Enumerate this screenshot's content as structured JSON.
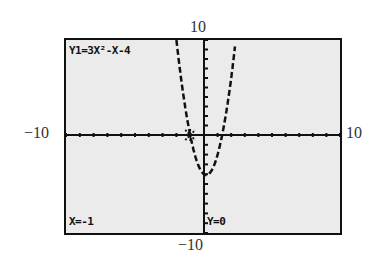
{
  "window": {
    "ymax_label": "10",
    "ymin_label": "−10",
    "xmin_label": "−10",
    "xmax_label": "10"
  },
  "screen": {
    "equation": "Y1=3X²-X-4",
    "trace_x": "X=-1",
    "trace_y": "Y=0",
    "background_color": "#ebebeb",
    "ink_color": "#111111"
  },
  "chart_data": {
    "type": "line",
    "title": "Y1=3X²-X-4",
    "function": "3x^2 - x - 4",
    "xlim": [
      -10,
      10
    ],
    "ylim": [
      -10,
      10
    ],
    "xscale": 1,
    "yscale": 1,
    "grid": false,
    "axes": true,
    "trace_point": {
      "x": -1,
      "y": 0
    },
    "x_intercepts": [
      -1,
      1.333
    ],
    "y_intercept": -4,
    "series": [
      {
        "name": "Y1",
        "style": "dashed",
        "x": [
          -1.8,
          -1.6,
          -1.4,
          -1.2,
          -1.0,
          -0.8,
          -0.6,
          -0.4,
          -0.2,
          0.0,
          0.2,
          0.4,
          0.6,
          0.8,
          1.0,
          1.2,
          1.4,
          1.6,
          1.8,
          2.0,
          2.2
        ],
        "y": [
          7.52,
          5.28,
          3.28,
          1.52,
          0.0,
          -1.28,
          -2.32,
          -3.12,
          -3.68,
          -4.0,
          -4.08,
          -3.92,
          -3.52,
          -2.88,
          -2.0,
          -0.88,
          0.48,
          2.08,
          3.92,
          6.0,
          8.32
        ]
      }
    ],
    "xlabel": "",
    "ylabel": ""
  }
}
